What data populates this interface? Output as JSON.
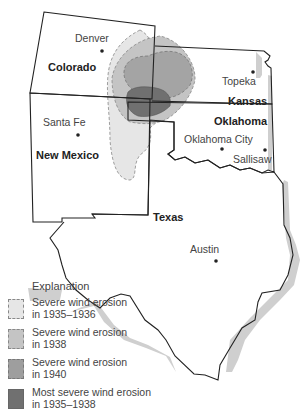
{
  "map": {
    "states": [
      {
        "name": "Colorado",
        "x": 48,
        "y": 67
      },
      {
        "name": "Kansas",
        "x": 228,
        "y": 101
      },
      {
        "name": "Oklahoma",
        "x": 214,
        "y": 121
      },
      {
        "name": "New Mexico",
        "x": 36,
        "y": 155
      },
      {
        "name": "Texas",
        "x": 165,
        "y": 215
      }
    ],
    "cities": [
      {
        "name": "Denver",
        "label_x": 73,
        "label_y": 37,
        "dot_x": 102,
        "dot_y": 51
      },
      {
        "name": "Topeka",
        "label_x": 222,
        "label_y": 74,
        "dot_x": 253,
        "dot_y": 72
      },
      {
        "name": "Santa Fe",
        "label_x": 43,
        "label_y": 121,
        "dot_x": 78,
        "dot_y": 135
      },
      {
        "name": "Oklahoma City",
        "label_x": 184,
        "label_y": 134,
        "dot_x": 221,
        "dot_y": 149
      },
      {
        "name": "Sallisaw",
        "label_x": 232,
        "label_y": 152,
        "dot_x": 265,
        "dot_y": 150
      },
      {
        "name": "Austin",
        "label_x": 190,
        "label_y": 242,
        "dot_x": 216,
        "dot_y": 261
      }
    ]
  },
  "legend": {
    "title": "Explanation",
    "items": [
      {
        "label_line1": "Severe wind erosion",
        "label_line2": "in 1935–1936",
        "color": "#e6e6e6",
        "dashed": true
      },
      {
        "label_line1": "Severe wind erosion",
        "label_line2": "in 1938",
        "color": "#c4c4c4",
        "dashed": true
      },
      {
        "label_line1": "Severe wind erosion",
        "label_line2": "in 1940",
        "color": "#9e9e9e",
        "dashed": true
      },
      {
        "label_line1": "Most severe wind erosion",
        "label_line2": "in 1935–1938",
        "color": "#707070",
        "dashed": false
      }
    ]
  },
  "colors": {
    "zone_1935_1936": "#e6e6e6",
    "zone_1938": "#c4c4c4",
    "zone_1940": "#9e9e9e",
    "zone_most_severe": "#707070",
    "border": "#222222",
    "shadow": "#c8c8c8"
  }
}
